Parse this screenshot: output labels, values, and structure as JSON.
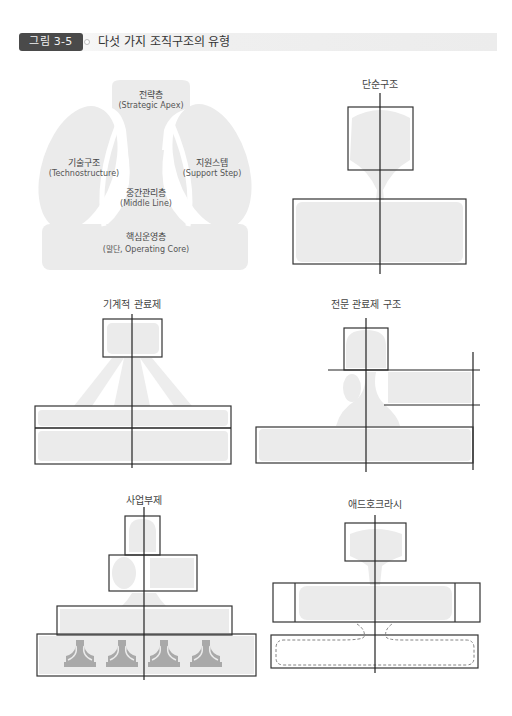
{
  "figure": {
    "badge": "그림 3-5",
    "title": "다섯 가지 조직구조의 유형"
  },
  "colors": {
    "badge_bg": "#4a4a4a",
    "fill_light": "#ebebeb",
    "fill_dark": "#a9a9a9",
    "line": "#333333"
  },
  "overview": {
    "parts": [
      {
        "ko": "전략층",
        "en": "(Strategic Apex)"
      },
      {
        "ko": "기술구조",
        "en": "(Technostructure)"
      },
      {
        "ko": "지원스텝",
        "en": "(Support Step)"
      },
      {
        "ko": "중간관리층",
        "en": "(Middle Line)"
      },
      {
        "ko": "핵심운영층",
        "en": "(말단, Operating Core)"
      }
    ]
  },
  "diagrams": [
    {
      "title": "단순구조"
    },
    {
      "title": "기계적 관료제"
    },
    {
      "title": "전문 관료제 구조"
    },
    {
      "title": "사업부제"
    },
    {
      "title": "애드호크라시"
    }
  ]
}
